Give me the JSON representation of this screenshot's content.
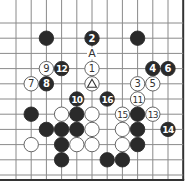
{
  "diagram": {
    "type": "go-board-fragment",
    "grid": {
      "columns": 12,
      "rows": 11,
      "origin_x": 16,
      "origin_y": 23,
      "spacing": 15.2,
      "right_edge": true,
      "bottom_edge": true
    },
    "colors": {
      "line": "#8a8a8a",
      "edge": "#333333",
      "black_stone": "#2a2a2a",
      "white_stone": "#ffffff",
      "stone_outline": "#555555",
      "black_label": "#ffffff",
      "white_label": "#333333"
    },
    "stones": [
      {
        "col": 2,
        "row": 1,
        "color": "black",
        "label": ""
      },
      {
        "col": 5,
        "row": 1,
        "color": "black",
        "label": "2"
      },
      {
        "col": 8,
        "row": 1,
        "color": "black",
        "label": ""
      },
      {
        "col": 2,
        "row": 3,
        "color": "white",
        "label": "9"
      },
      {
        "col": 3,
        "row": 3,
        "color": "black",
        "label": "12"
      },
      {
        "col": 5,
        "row": 3,
        "color": "white",
        "label": "1"
      },
      {
        "col": 9,
        "row": 3,
        "color": "black",
        "label": "4"
      },
      {
        "col": 10,
        "row": 3,
        "color": "black",
        "label": "6"
      },
      {
        "col": 1,
        "row": 4,
        "color": "white",
        "label": "7"
      },
      {
        "col": 2,
        "row": 4,
        "color": "black",
        "label": "8"
      },
      {
        "col": 5,
        "row": 4,
        "color": "white",
        "label": "△"
      },
      {
        "col": 8,
        "row": 4,
        "color": "white",
        "label": "3"
      },
      {
        "col": 9,
        "row": 4,
        "color": "white",
        "label": "5"
      },
      {
        "col": 4,
        "row": 5,
        "color": "black",
        "label": "10"
      },
      {
        "col": 6,
        "row": 5,
        "color": "black",
        "label": "16"
      },
      {
        "col": 8,
        "row": 5,
        "color": "white",
        "label": "11"
      },
      {
        "col": 1,
        "row": 6,
        "color": "black",
        "label": ""
      },
      {
        "col": 3,
        "row": 6,
        "color": "white",
        "label": ""
      },
      {
        "col": 4,
        "row": 6,
        "color": "black",
        "label": ""
      },
      {
        "col": 5,
        "row": 6,
        "color": "white",
        "label": ""
      },
      {
        "col": 7,
        "row": 6,
        "color": "white",
        "label": "15"
      },
      {
        "col": 8,
        "row": 6,
        "color": "black",
        "label": ""
      },
      {
        "col": 9,
        "row": 6,
        "color": "white",
        "label": "13"
      },
      {
        "col": 2,
        "row": 7,
        "color": "black",
        "label": ""
      },
      {
        "col": 3,
        "row": 7,
        "color": "black",
        "label": ""
      },
      {
        "col": 4,
        "row": 7,
        "color": "black",
        "label": ""
      },
      {
        "col": 5,
        "row": 7,
        "color": "white",
        "label": ""
      },
      {
        "col": 7,
        "row": 7,
        "color": "white",
        "label": ""
      },
      {
        "col": 8,
        "row": 7,
        "color": "black",
        "label": ""
      },
      {
        "col": 10,
        "row": 7,
        "color": "black",
        "label": "14"
      },
      {
        "col": 1,
        "row": 8,
        "color": "white",
        "label": ""
      },
      {
        "col": 3,
        "row": 8,
        "color": "black",
        "label": ""
      },
      {
        "col": 4,
        "row": 8,
        "color": "white",
        "label": ""
      },
      {
        "col": 5,
        "row": 8,
        "color": "white",
        "label": ""
      },
      {
        "col": 7,
        "row": 8,
        "color": "white",
        "label": ""
      },
      {
        "col": 8,
        "row": 8,
        "color": "black",
        "label": ""
      },
      {
        "col": 3,
        "row": 9,
        "color": "black",
        "label": ""
      },
      {
        "col": 6,
        "row": 9,
        "color": "black",
        "label": ""
      },
      {
        "col": 7,
        "row": 9,
        "color": "black",
        "label": ""
      }
    ],
    "markers": [
      {
        "col": 5,
        "row": 2,
        "text": "A"
      }
    ]
  }
}
